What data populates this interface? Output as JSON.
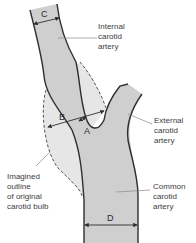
{
  "diagram": {
    "colors": {
      "vessel_fill": "#cfcfcf",
      "bulb_fill": "#e6e6e6",
      "outline": "#2e2e2e",
      "dashed": "#555555",
      "leader": "#8a8a8a",
      "text": "#3c3c3c"
    },
    "labels": {
      "internal": "Internal\ncarotid\nartery",
      "external": "External\ncarotid\nartery",
      "common": "Common\ncarotid\nartery",
      "imagined": "Imagined\noutline\nof original\ncarotid bulb"
    },
    "measurements": {
      "a": "A",
      "b": "B",
      "c": "C",
      "d": "D"
    }
  }
}
